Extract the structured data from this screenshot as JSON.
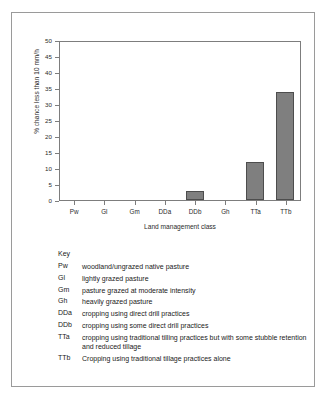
{
  "chart_data": {
    "type": "bar",
    "title": "",
    "categories": [
      "Pw",
      "Gl",
      "Gm",
      "DDa",
      "DDb",
      "Gh",
      "TTa",
      "TTb"
    ],
    "values": [
      0,
      0,
      0,
      0,
      2.7,
      0,
      12,
      33.8
    ],
    "xlabel": "Land management class",
    "ylabel": "% chance  less than 10 mm/h",
    "ylim": [
      0,
      50
    ],
    "ytick_labels": [
      "0",
      "5",
      "10",
      "15",
      "20",
      "25",
      "30",
      "35",
      "40",
      "45",
      "50"
    ],
    "ytick_values": [
      0,
      5,
      10,
      15,
      20,
      25,
      30,
      35,
      40,
      45,
      50
    ],
    "grid": false,
    "legend_position": "below-plot",
    "bar_color": "#7f7f7f",
    "bar_edge_color": "#4d4d4d"
  },
  "key": {
    "title": "Key",
    "entries": [
      {
        "abbr": "Pw",
        "desc": "woodland/ungrazed native pasture"
      },
      {
        "abbr": "Gl",
        "desc": "lightly grazed pasture"
      },
      {
        "abbr": "Gm",
        "desc": "pasture grazed at moderate intensity"
      },
      {
        "abbr": "Gh",
        "desc": "heavily grazed pasture"
      },
      {
        "abbr": "DDa",
        "desc": "cropping using direct drill practices"
      },
      {
        "abbr": "DDb",
        "desc": "cropping using some direct drill practices"
      },
      {
        "abbr": "TTa",
        "desc": "cropping using traditional tilling practices but with some stubble retention and reduced tillage"
      },
      {
        "abbr": "TTb",
        "desc": "Cropping using traditional tillage practices alone"
      }
    ]
  }
}
